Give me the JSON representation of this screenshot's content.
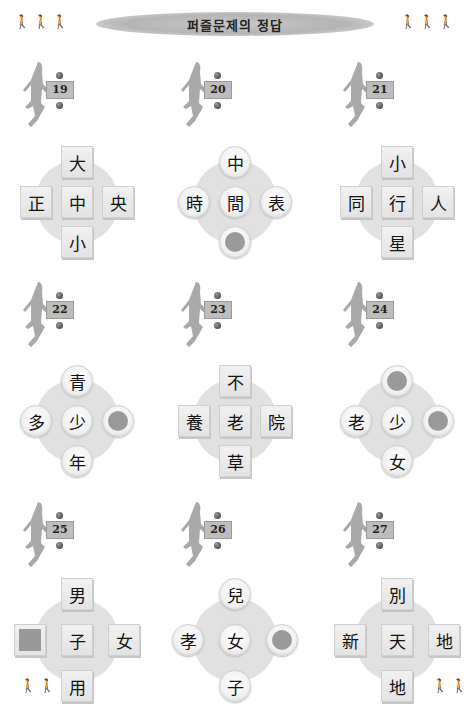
{
  "header": {
    "title": "퍼즐문제의 정답"
  },
  "puzzles": [
    {
      "number": "19",
      "shape": "square",
      "top": "大",
      "left": "正",
      "center": "中",
      "right": "央",
      "bottom": "小"
    },
    {
      "number": "20",
      "shape": "circle",
      "top": "中",
      "left": "時",
      "center": "間",
      "right": "表",
      "bottom": ""
    },
    {
      "number": "21",
      "shape": "square",
      "top": "小",
      "left": "同",
      "center": "行",
      "right": "人",
      "bottom": "星"
    },
    {
      "number": "22",
      "shape": "circle",
      "top": "青",
      "left": "多",
      "center": "少",
      "right": "",
      "bottom": "年"
    },
    {
      "number": "23",
      "shape": "square",
      "top": "不",
      "left": "養",
      "center": "老",
      "right": "院",
      "bottom": "草"
    },
    {
      "number": "24",
      "shape": "circle",
      "top": "",
      "left": "老",
      "center": "少",
      "right": "",
      "bottom": "女"
    },
    {
      "number": "25",
      "shape": "square",
      "top": "男",
      "left": "",
      "center": "子",
      "right": "女",
      "bottom": "用"
    },
    {
      "number": "26",
      "shape": "circle",
      "top": "兒",
      "left": "孝",
      "center": "女",
      "right": "",
      "bottom": "子"
    },
    {
      "number": "27",
      "shape": "square",
      "top": "別",
      "left": "新",
      "center": "天",
      "right": "地",
      "bottom": "地"
    }
  ]
}
